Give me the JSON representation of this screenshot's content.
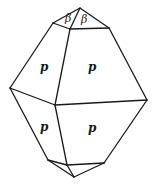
{
  "diagram": {
    "type": "crystal-drawing",
    "faces": {
      "upper_left": "p",
      "upper_right": "p",
      "lower_left": "p",
      "lower_right": "p",
      "top_left": "β",
      "top_right": "β"
    },
    "colors": {
      "line": "#1a1a1a",
      "background": "#ffffff"
    }
  }
}
